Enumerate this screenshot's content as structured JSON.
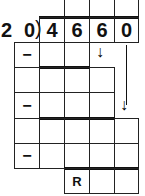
{
  "divisor": [
    "2",
    "0"
  ],
  "bracket": ")",
  "dividend": [
    "4",
    "6",
    "6",
    "0"
  ],
  "minus_sign": "−",
  "remainder_label": "R",
  "arrow": "↓"
}
